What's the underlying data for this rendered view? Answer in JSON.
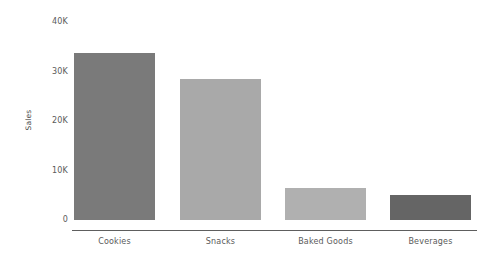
{
  "chart_data": {
    "type": "bar",
    "title": "",
    "subtitle": "",
    "xlabel": "",
    "ylabel": "Sales",
    "categories": [
      "Cookies",
      "Snacks",
      "Baked Goods",
      "Beverages"
    ],
    "values": [
      33700,
      28500,
      6500,
      5000
    ],
    "value_labels": [
      "33.7K",
      "28.5K",
      "6.5K",
      "5.0K"
    ],
    "bar_colors": [
      "#7a7a7a",
      "#a9a9a9",
      "#b0b0b0",
      "#656565"
    ],
    "ylim": [
      0,
      40000
    ],
    "yticks": [
      0,
      10000,
      20000,
      30000,
      40000
    ],
    "ytick_labels": [
      "0",
      "10K",
      "20K",
      "30K",
      "40K"
    ],
    "grid": false,
    "legend": false,
    "legend_position": "none",
    "background_color": "#ffffff",
    "axis_color": "#5e5e5e",
    "tick_text_color": "#5a5a5a"
  }
}
